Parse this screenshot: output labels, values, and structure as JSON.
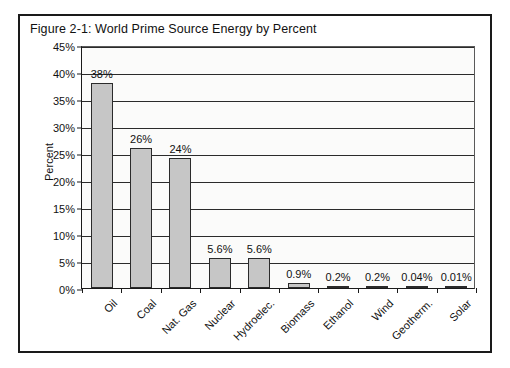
{
  "figure": {
    "title": "Figure 2-1:  World Prime Source Energy by Percent",
    "frame_color": "#1a1a1a",
    "bar_fill": "#c6c6c6",
    "bar_edge": "#2b2b2b",
    "plot_background": "#fbfbfa"
  },
  "chart_data": {
    "type": "bar",
    "title": "Figure 2-1:  World Prime Source Energy by Percent",
    "xlabel": "",
    "ylabel": "Percent",
    "ylim": [
      0,
      45
    ],
    "ytick_labels": [
      "0%",
      "5%",
      "10%",
      "15%",
      "20%",
      "25%",
      "30%",
      "35%",
      "40%",
      "45%"
    ],
    "ytick_values": [
      0,
      5,
      10,
      15,
      20,
      25,
      30,
      35,
      40,
      45
    ],
    "grid": true,
    "legend": false,
    "categories": [
      "Oil",
      "Coal",
      "Nat. Gas",
      "Nuclear",
      "Hydroelec.",
      "Biomass",
      "Ethanol",
      "Wind",
      "Geotherm.",
      "Solar"
    ],
    "values": [
      38,
      26,
      24,
      5.6,
      5.6,
      0.9,
      0.2,
      0.2,
      0.04,
      0.01
    ],
    "data_labels": [
      "38%",
      "26%",
      "24%",
      "5.6%",
      "5.6%",
      "0.9%",
      "0.2%",
      "0.2%",
      "0.04%",
      "0.01%"
    ]
  }
}
